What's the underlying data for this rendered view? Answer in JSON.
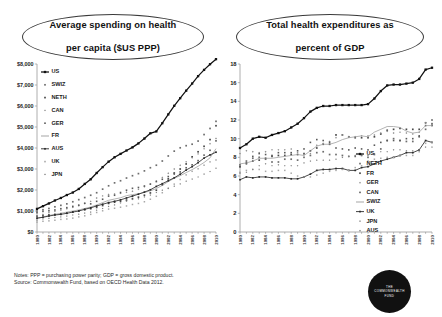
{
  "notes": {
    "line1": "Notes: PPP = purchasing power parity; GDP = gross domestic product.",
    "line2": "Source: Commonwealth Fund, based on OECD Health Data 2012."
  },
  "logo": {
    "line1": "THE",
    "line2": "COMMONWEALTH",
    "line3": "FUND"
  },
  "chart_data": [
    {
      "id": "spending",
      "type": "line",
      "title": "Average spending on health per capita ($US PPP)",
      "title_line1": "Average spending on health",
      "title_line2": "per capita ($US PPP)",
      "xlabel": "",
      "ylabel": "",
      "ylim": [
        0,
        8000
      ],
      "yticks": [
        0,
        1000,
        2000,
        3000,
        4000,
        5000,
        6000,
        7000,
        8000
      ],
      "ytick_labels": [
        "$0",
        "$1,000",
        "$2,000",
        "$3,000",
        "$4,000",
        "$5,000",
        "$6,000",
        "$7,000",
        "$8,000"
      ],
      "grid": false,
      "legend_position": "upper-left",
      "x": [
        1980,
        1981,
        1982,
        1983,
        1984,
        1985,
        1986,
        1987,
        1988,
        1989,
        1990,
        1991,
        1992,
        1993,
        1994,
        1995,
        1996,
        1997,
        1998,
        1999,
        2000,
        2001,
        2002,
        2003,
        2004,
        2005,
        2006,
        2007,
        2008,
        2009,
        2010
      ],
      "xtick_labels": [
        "1980",
        "1982",
        "1984",
        "1986",
        "1988",
        "1990",
        "1992",
        "1994",
        "1996",
        "1998",
        "2000",
        "2002",
        "2004",
        "2006",
        "2008",
        "2010"
      ],
      "series": [
        {
          "name": "US",
          "values": [
            1100,
            1230,
            1360,
            1500,
            1620,
            1760,
            1880,
            2050,
            2290,
            2510,
            2810,
            3090,
            3350,
            3560,
            3720,
            3880,
            4030,
            4220,
            4450,
            4700,
            4790,
            5180,
            5600,
            6010,
            6370,
            6730,
            7070,
            7420,
            7720,
            7990,
            8230
          ]
        },
        {
          "name": "SWIZ",
          "values": [
            1000,
            1060,
            1120,
            1200,
            1270,
            1340,
            1440,
            1540,
            1640,
            1750,
            1870,
            2040,
            2200,
            2340,
            2440,
            2570,
            2680,
            2780,
            2910,
            3060,
            3180,
            3380,
            3620,
            3850,
            4010,
            4110,
            4180,
            4330,
            4640,
            4930,
            5270
          ]
        },
        {
          "name": "NETH",
          "values": [
            760,
            790,
            820,
            840,
            870,
            900,
            950,
            1000,
            1060,
            1110,
            1170,
            1260,
            1360,
            1420,
            1460,
            1520,
            1590,
            1660,
            1750,
            1860,
            1990,
            2240,
            2530,
            2810,
            3000,
            3240,
            3580,
            3820,
            4080,
            4400,
            5060
          ]
        },
        {
          "name": "CAN",
          "values": [
            780,
            840,
            930,
            990,
            1040,
            1110,
            1180,
            1250,
            1350,
            1460,
            1620,
            1720,
            1790,
            1810,
            1840,
            1890,
            1940,
            2030,
            2150,
            2280,
            2430,
            2600,
            2800,
            3000,
            3180,
            3340,
            3530,
            3720,
            3960,
            4200,
            4450
          ]
        },
        {
          "name": "GER",
          "values": [
            920,
            980,
            1010,
            1050,
            1110,
            1160,
            1220,
            1280,
            1370,
            1340,
            1460,
            1560,
            1710,
            1750,
            1880,
            1990,
            2080,
            2120,
            2190,
            2280,
            2400,
            2510,
            2640,
            2760,
            2860,
            3060,
            3200,
            3400,
            3660,
            3890,
            4340
          ]
        },
        {
          "name": "FR",
          "values": [
            650,
            710,
            790,
            840,
            890,
            950,
            1000,
            1050,
            1120,
            1190,
            1290,
            1400,
            1510,
            1570,
            1630,
            1730,
            1780,
            1820,
            1880,
            1960,
            2070,
            2220,
            2400,
            2560,
            2680,
            2830,
            2970,
            3130,
            3310,
            3530,
            3970
          ]
        },
        {
          "name": "AUS",
          "values": [
            660,
            700,
            760,
            810,
            840,
            890,
            950,
            1000,
            1080,
            1150,
            1240,
            1320,
            1400,
            1460,
            1530,
            1620,
            1710,
            1800,
            1900,
            2010,
            2170,
            2300,
            2440,
            2580,
            2750,
            2950,
            3110,
            3300,
            3520,
            3670,
            3800
          ]
        },
        {
          "name": "UK",
          "values": [
            470,
            510,
            530,
            560,
            600,
            620,
            660,
            720,
            770,
            840,
            930,
            1010,
            1090,
            1130,
            1180,
            1240,
            1310,
            1360,
            1440,
            1560,
            1700,
            1870,
            2080,
            2280,
            2500,
            2720,
            2890,
            3010,
            3180,
            3340,
            3430
          ]
        },
        {
          "name": "JPN",
          "values": [
            570,
            620,
            650,
            690,
            720,
            760,
            810,
            850,
            900,
            950,
            1040,
            1120,
            1220,
            1290,
            1380,
            1470,
            1550,
            1580,
            1670,
            1760,
            1880,
            1990,
            2080,
            2180,
            2290,
            2420,
            2520,
            2620,
            2760,
            2880,
            3040
          ]
        }
      ]
    },
    {
      "id": "gdp",
      "type": "line",
      "title": "Total health expenditures as percent of GDP",
      "title_line1": "Total health expenditures as",
      "title_line2": "percent of GDP",
      "xlabel": "",
      "ylabel": "",
      "ylim": [
        0,
        18
      ],
      "yticks": [
        0,
        2,
        4,
        6,
        8,
        10,
        12,
        14,
        16,
        18
      ],
      "ytick_labels": [
        "0",
        "2",
        "4",
        "6",
        "8",
        "10",
        "12",
        "14",
        "16",
        "18"
      ],
      "grid": false,
      "legend_position": "lower-right",
      "x": [
        1980,
        1981,
        1982,
        1983,
        1984,
        1985,
        1986,
        1987,
        1988,
        1989,
        1990,
        1991,
        1992,
        1993,
        1994,
        1995,
        1996,
        1997,
        1998,
        1999,
        2000,
        2001,
        2002,
        2003,
        2004,
        2005,
        2006,
        2007,
        2008,
        2009,
        2010
      ],
      "xtick_labels": [
        "1980",
        "1982",
        "1984",
        "1986",
        "1988",
        "1990",
        "1992",
        "1994",
        "1996",
        "1998",
        "2000",
        "2002",
        "2004",
        "2006",
        "2008",
        "2010"
      ],
      "series": [
        {
          "name": "US",
          "values": [
            9.0,
            9.4,
            10.0,
            10.2,
            10.1,
            10.4,
            10.6,
            10.8,
            11.2,
            11.6,
            12.2,
            12.9,
            13.3,
            13.5,
            13.5,
            13.6,
            13.6,
            13.6,
            13.6,
            13.6,
            13.7,
            14.3,
            15.1,
            15.7,
            15.8,
            15.8,
            15.9,
            16.0,
            16.4,
            17.4,
            17.6
          ]
        },
        {
          "name": "NETH",
          "values": [
            7.2,
            7.6,
            7.9,
            8.0,
            7.8,
            7.5,
            7.5,
            7.8,
            7.8,
            7.7,
            8.0,
            8.2,
            8.5,
            8.6,
            8.3,
            8.3,
            8.2,
            8.1,
            8.1,
            8.2,
            8.0,
            8.3,
            8.9,
            9.8,
            10.0,
            9.8,
            9.7,
            9.7,
            10.2,
            11.0,
            12.0
          ]
        },
        {
          "name": "FR",
          "values": [
            7.0,
            7.4,
            7.6,
            7.7,
            7.9,
            8.1,
            8.2,
            8.2,
            8.3,
            8.3,
            8.4,
            8.7,
            9.0,
            9.4,
            9.4,
            10.4,
            10.4,
            10.2,
            10.1,
            10.1,
            10.1,
            10.2,
            10.5,
            10.9,
            11.0,
            11.1,
            11.0,
            11.0,
            11.0,
            11.7,
            11.6
          ]
        },
        {
          "name": "GER",
          "values": [
            8.4,
            8.7,
            8.6,
            8.5,
            8.6,
            8.8,
            8.8,
            8.8,
            8.9,
            8.5,
            8.3,
            8.4,
            9.3,
            9.5,
            9.7,
            10.1,
            10.4,
            10.2,
            10.2,
            10.3,
            10.3,
            10.4,
            10.6,
            10.8,
            10.6,
            10.7,
            10.6,
            10.5,
            10.7,
            11.7,
            11.6
          ]
        },
        {
          "name": "CAN",
          "values": [
            7.0,
            7.3,
            8.1,
            8.4,
            8.3,
            8.2,
            8.5,
            8.5,
            8.5,
            8.7,
            8.9,
            9.6,
            9.9,
            9.8,
            9.6,
            9.0,
            8.9,
            8.8,
            9.0,
            8.9,
            8.8,
            9.3,
            9.6,
            9.8,
            9.8,
            9.8,
            10.0,
            10.0,
            10.3,
            11.4,
            11.4
          ]
        },
        {
          "name": "SWIZ",
          "values": [
            7.3,
            7.4,
            7.6,
            7.9,
            7.9,
            7.9,
            8.0,
            8.1,
            8.2,
            8.3,
            8.2,
            8.7,
            9.2,
            9.4,
            9.4,
            9.6,
            9.9,
            10.1,
            10.2,
            10.3,
            10.2,
            10.7,
            11.0,
            11.3,
            11.3,
            11.2,
            10.8,
            10.6,
            10.7,
            11.4,
            11.4
          ]
        },
        {
          "name": "UK",
          "values": [
            5.6,
            5.9,
            5.8,
            5.9,
            5.9,
            5.8,
            5.8,
            5.8,
            5.7,
            5.7,
            5.9,
            6.2,
            6.6,
            6.7,
            6.7,
            6.8,
            6.8,
            6.6,
            6.6,
            6.9,
            7.0,
            7.3,
            7.6,
            7.8,
            8.0,
            8.2,
            8.5,
            8.5,
            8.8,
            9.8,
            9.6
          ]
        },
        {
          "name": "JPN",
          "values": [
            6.4,
            6.6,
            6.7,
            6.7,
            6.5,
            6.5,
            6.6,
            6.6,
            6.3,
            6.0,
            5.9,
            5.9,
            6.1,
            6.3,
            6.5,
            6.6,
            6.7,
            6.6,
            6.9,
            7.1,
            7.6,
            7.8,
            7.9,
            8.0,
            8.0,
            8.2,
            8.2,
            8.2,
            8.6,
            9.5,
            9.6
          ]
        },
        {
          "name": "AUS",
          "values": [
            6.3,
            6.4,
            6.7,
            7.1,
            7.3,
            7.1,
            7.2,
            7.1,
            7.1,
            7.1,
            7.4,
            7.6,
            7.7,
            7.7,
            7.7,
            7.8,
            8.0,
            8.1,
            8.2,
            8.2,
            8.2,
            8.4,
            8.6,
            8.6,
            8.8,
            8.8,
            8.7,
            8.7,
            8.8,
            9.1,
            9.1
          ]
        }
      ]
    }
  ]
}
